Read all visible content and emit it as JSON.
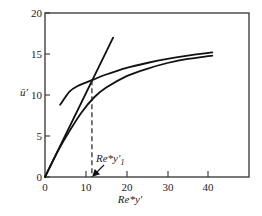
{
  "chart_data": {
    "type": "line",
    "title": "",
    "xlabel": "Re*y′",
    "ylabel": "ū′",
    "xlim": [
      0,
      50
    ],
    "ylim": [
      0,
      20
    ],
    "grid": false,
    "legend": null,
    "x_ticks": [
      0,
      10,
      20,
      30,
      40
    ],
    "y_ticks": [
      0,
      5,
      10,
      15,
      20
    ],
    "x_tick_labels": [
      "0",
      "10",
      "20",
      "30",
      "40"
    ],
    "y_tick_labels": [
      "0",
      "5",
      "10",
      "15",
      "20"
    ],
    "series": [
      {
        "name": "linear (viscous sublayer)",
        "x": [
          0,
          16.7
        ],
        "y": [
          0,
          17.0
        ]
      },
      {
        "name": "log-law (upper curve)",
        "x": [
          3.7,
          6,
          8,
          11.5,
          15,
          20,
          25,
          30,
          35,
          41
        ],
        "y": [
          8.8,
          10.4,
          11.1,
          11.8,
          12.5,
          13.3,
          13.9,
          14.4,
          14.8,
          15.2
        ]
      },
      {
        "name": "lower curve",
        "x": [
          0,
          3,
          6,
          9,
          12,
          15,
          20,
          25,
          30,
          35,
          41
        ],
        "y": [
          0,
          3.0,
          5.6,
          7.9,
          9.7,
          10.9,
          12.3,
          13.2,
          13.9,
          14.4,
          14.8
        ]
      }
    ],
    "annotations": [
      {
        "text": "Re*y′₁",
        "x": 11.5,
        "y": 0,
        "note": "dashed vertical line from intersection (11.5, 11.8) down to x-axis, arrow pointing to axis"
      }
    ]
  },
  "labels": {
    "y_axis": "ū′",
    "x_axis": "Re*y′",
    "annotation_main": "Re*y′",
    "annotation_sub": "1"
  }
}
